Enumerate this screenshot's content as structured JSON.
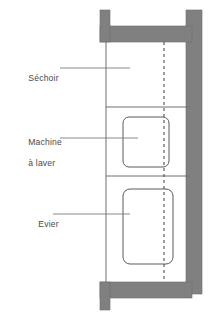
{
  "diagram": {
    "type": "floor-plan",
    "colors": {
      "wall_fill": "#808080",
      "wall_stroke": "#6b6b6b",
      "partition_line": "#6e6e6e",
      "appliance_outline": "#5a5a5a",
      "center_line": "#4f4f4f",
      "leader_line": "#7a7a7a",
      "text": "#4a4a4a",
      "background": "#ffffff"
    },
    "labels": [
      {
        "id": "sechoir",
        "name": "Séchoir",
        "lines": [
          "Séchoir"
        ],
        "leader_from_x": 60,
        "leader_to_x": 130,
        "leader_y": 68
      },
      {
        "id": "machine-a-laver",
        "name": "Machine à laver",
        "lines": [
          "Machine",
          "à laver"
        ],
        "leader_from_x": 60,
        "leader_to_x": 138,
        "leader_y": 138
      },
      {
        "id": "evier",
        "name": "Evier",
        "lines": [
          "Evier"
        ],
        "leader_from_x": 53,
        "leader_to_x": 130,
        "leader_y": 214
      }
    ],
    "appliances": [
      {
        "id": "machine-a-laver-outline",
        "name": "Machine à laver",
        "x": 123,
        "y": 117,
        "width": 46,
        "height": 50,
        "corner_radius": 6
      },
      {
        "id": "evier-outline",
        "name": "Evier",
        "x": 123,
        "y": 189,
        "width": 50,
        "height": 75,
        "corner_radius": 7
      }
    ],
    "partitions": [
      {
        "id": "partition-sechoir-machine",
        "y": 107,
        "x1": 106,
        "x2": 192
      },
      {
        "id": "partition-machine-evier",
        "y": 176,
        "x1": 106,
        "x2": 192
      }
    ],
    "center_line": {
      "id": "axe-dashed",
      "x": 164,
      "y1": 42,
      "y2": 282,
      "dash": "3 3"
    },
    "left_boundary": {
      "id": "cloison-gauche",
      "x": 106,
      "y1": 42,
      "y2": 282
    }
  }
}
